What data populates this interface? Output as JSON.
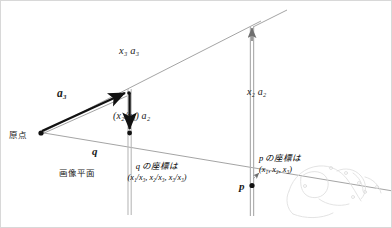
{
  "figure": {
    "background_color": "#ffffff",
    "stroke_dark": "#111111",
    "stroke_light": "#8e8e8e",
    "stroke_faint": "#d9d9d9"
  },
  "labels": {
    "x3a3": "x₃ a₃",
    "a3": "a₃",
    "x2a2": "x₂ a₂",
    "x2x3a2": "(x₂/x₃) a₂",
    "origin": "原点",
    "q_point": "q",
    "image_plane": "画像平面",
    "p_point": "p",
    "q_caption_line1": "q の座標は",
    "q_caption_line2": "(x₁/x₃, x₂/x₃, x₃/x₃)",
    "p_caption_line1": "p の座標は",
    "p_caption_line2": "(x₁, x₂, x₃)"
  },
  "geometry": {
    "origin_point": [
      40,
      132
    ],
    "q_point": [
      128,
      134
    ],
    "p_point": [
      251,
      185
    ],
    "a3_tip": [
      128,
      92
    ],
    "ray_far_end": [
      251,
      25
    ],
    "image_plane_left": [
      40,
      132
    ],
    "image_plane_right": [
      392,
      190
    ],
    "vertical_line_q_top": [
      128,
      92
    ],
    "vertical_line_p_top": [
      251,
      25
    ]
  },
  "sketch": {
    "name": "faint-line-drawing",
    "description": "faint grey contour sketch in lower right corner"
  }
}
